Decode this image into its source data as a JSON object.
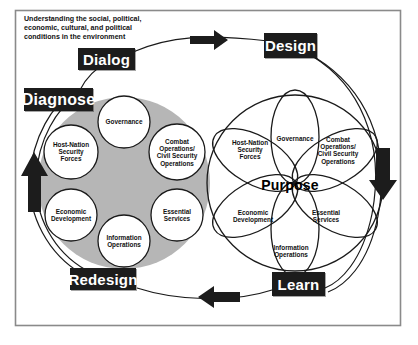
{
  "frame": {
    "border_color": "#8a8a8a",
    "background": "#ffffff"
  },
  "intro": {
    "text": "Understanding the social, political, economic, cultural, and political conditions in the environment"
  },
  "colors": {
    "label_box_bg": "#1c1c1c",
    "label_box_text": "#ffffff",
    "gray_disc": "#b5b5b5",
    "node_fill": "#ffffff",
    "stroke": "#1a1a1a",
    "arrow": "#1c1c1c"
  },
  "stage_labels": [
    {
      "id": "dialog",
      "text": "Dialog"
    },
    {
      "id": "design",
      "text": "Design"
    },
    {
      "id": "diagnose",
      "text": "Diagnose"
    },
    {
      "id": "redesign",
      "text": "Redesign"
    },
    {
      "id": "learn",
      "text": "Learn"
    }
  ],
  "arrows": [
    {
      "id": "top",
      "direction": "right"
    },
    {
      "id": "right",
      "direction": "down"
    },
    {
      "id": "bottom",
      "direction": "left"
    },
    {
      "id": "left",
      "direction": "up"
    }
  ],
  "left_model": {
    "type": "gray-disc-with-circles",
    "center_text": "",
    "nodes": [
      {
        "id": "governance",
        "text": "Governance"
      },
      {
        "id": "combat-ops",
        "text": "Combat Operations/ Civil Security Operations"
      },
      {
        "id": "essential",
        "text": "Essential Services"
      },
      {
        "id": "information",
        "text": "Information Operations"
      },
      {
        "id": "economic",
        "text": "Economic Development"
      },
      {
        "id": "host-nation",
        "text": "Host-Nation Security Forces"
      }
    ]
  },
  "right_model": {
    "type": "petal-flower",
    "center_text": "Purpose",
    "nodes": [
      {
        "id": "governance",
        "text": "Governance"
      },
      {
        "id": "combat-ops",
        "text": "Combat Operations/ Civil Security Operations"
      },
      {
        "id": "essential",
        "text": "Essential Services"
      },
      {
        "id": "information",
        "text": "Information Operations"
      },
      {
        "id": "economic",
        "text": "Economic Development"
      },
      {
        "id": "host-nation",
        "text": "Host-Nation Security Forces"
      }
    ]
  }
}
